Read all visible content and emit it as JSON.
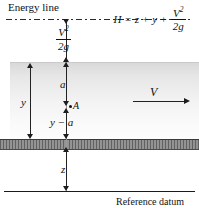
{
  "figure": {
    "title_label": "Energy line",
    "datum_label": "Reference datum",
    "equation": {
      "lhs": "H",
      "equals": "=",
      "term1": "z",
      "plus1": "+",
      "term2": "y",
      "plus2": "+",
      "frac_num_base": "V",
      "frac_num_sup": "2",
      "frac_den": "2g"
    },
    "velocity_head": {
      "num_base": "V",
      "num_sup": "2",
      "den": "2g"
    },
    "labels": {
      "depth_total": "y",
      "depth_above_point": "a",
      "point_name": "A",
      "depth_below_point": "y − a",
      "elevation": "z",
      "velocity": "V"
    },
    "colors": {
      "ink": "#111111",
      "water_top": "#d8d8d8",
      "water_bottom": "#fdfdfd",
      "bed": "#8f8f8f",
      "line": "#2b2b2b"
    }
  }
}
